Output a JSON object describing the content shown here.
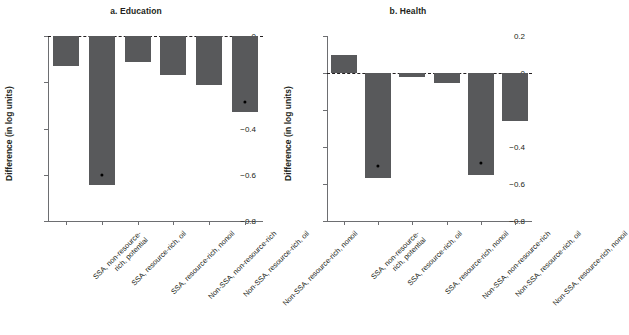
{
  "figure": {
    "ylabel": "Difference (in log units)",
    "bar_color": "#58595b",
    "marker_color": "#000000",
    "axis_color": "#6d6e71"
  },
  "chart_data": [
    {
      "type": "bar",
      "title": "a. Education",
      "xlabel": "",
      "ylabel": "Difference (in log units)",
      "ylim": [
        -0.8,
        0.0
      ],
      "yticks": [
        0,
        -0.2,
        -0.4,
        -0.6,
        -0.8
      ],
      "ytick_labels": [
        "0",
        "−0.2",
        "−0.4",
        "−0.6",
        "−0.8"
      ],
      "grid": false,
      "legend": "none",
      "zero_reference_line": 0,
      "categories": [
        "SSA, non-resource-\nrich, potential",
        "SSA, resource-rich, oil",
        "SSA, resource-rich, nonoil",
        "Non-SSA, non-resource-rich",
        "Non-SSA, resource-rich, oil",
        "Non-SSA, resource-rich, nonoil"
      ],
      "values": [
        -0.13,
        -0.645,
        -0.113,
        -0.168,
        -0.21,
        -0.33
      ],
      "markers": [
        null,
        -0.6,
        null,
        null,
        null,
        -0.285
      ]
    },
    {
      "type": "bar",
      "title": "b. Health",
      "xlabel": "",
      "ylabel": "Difference (in log units)",
      "ylim": [
        -0.8,
        0.2
      ],
      "yticks": [
        0.2,
        0,
        -0.2,
        -0.4,
        -0.6,
        -0.8
      ],
      "ytick_labels": [
        "0.2",
        "0",
        "−0.2",
        "−0.4",
        "−0.6",
        "−0.8"
      ],
      "grid": false,
      "legend": "none",
      "zero_reference_line": 0,
      "categories": [
        "SSA, non-resource-\nrich, potential",
        "SSA, resource-rich, oil",
        "SSA, resource-rich, nonoil",
        "Non-SSA, non-resource-rich",
        "Non-SSA, resource-rich, oil",
        "Non-SSA, resource-rich, nonoil"
      ],
      "values": [
        0.1,
        -0.57,
        -0.02,
        -0.055,
        -0.55,
        -0.26
      ],
      "markers": [
        null,
        -0.5,
        null,
        null,
        -0.487,
        null
      ]
    }
  ]
}
